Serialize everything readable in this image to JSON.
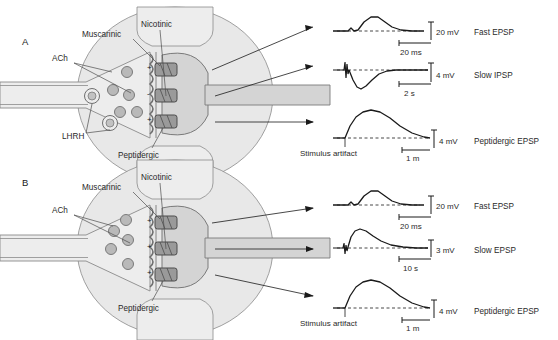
{
  "figure": {
    "width": 558,
    "height": 340,
    "background": "#ffffff"
  },
  "colors": {
    "cell_body_fill": "#e3e3e3",
    "axon_fill": "#ededed",
    "postsynaptic_fill": "#d2d2d2",
    "membrane_line": "#7a7a7a",
    "receptor_fill": "#9a9a9a",
    "vesicle_fill": "#b8b8b8",
    "trace_line": "#1a1a1a",
    "baseline_dash": "#1a1a1a",
    "text": "#2a2a2a"
  },
  "panels": [
    {
      "letter": "A",
      "diagram": {
        "presynaptic_labels": [
          {
            "name": "ACh",
            "text": "ACh"
          },
          {
            "name": "LHRH",
            "text": "LHRH"
          }
        ],
        "receptor_labels": [
          {
            "name": "Nicotinic",
            "text": "Nicotinic"
          },
          {
            "name": "Muscarinic",
            "text": "Muscarinic"
          },
          {
            "name": "Peptidergic",
            "text": "Peptidergic"
          }
        ],
        "receptor_signs": [
          "+",
          "-",
          "+"
        ]
      },
      "traces": [
        {
          "name": "Fast EPSP",
          "label": "Fast EPSP",
          "amplitude_scale": "20 mV",
          "time_scale": "20 ms",
          "polarity": "depolarizing",
          "shape": "fast-epsp"
        },
        {
          "name": "Slow IPSP",
          "label": "Slow IPSP",
          "amplitude_scale": "4 mV",
          "time_scale": "2 s",
          "polarity": "hyperpolarizing",
          "shape": "slow-ipsp"
        },
        {
          "name": "Peptidergic EPSP",
          "label": "Peptidergic EPSP",
          "amplitude_scale": "4 mV",
          "time_scale": "1 m",
          "polarity": "depolarizing",
          "shape": "peptidergic-epsp"
        }
      ],
      "annotation": "Stimulus artifact"
    },
    {
      "letter": "B",
      "diagram": {
        "presynaptic_labels": [
          {
            "name": "ACh",
            "text": "ACh"
          }
        ],
        "receptor_labels": [
          {
            "name": "Nicotinic",
            "text": "Nicotinic"
          },
          {
            "name": "Muscarinic",
            "text": "Muscarinic"
          },
          {
            "name": "Peptidergic",
            "text": "Peptidergic"
          }
        ],
        "receptor_signs": [
          "+",
          "+",
          "+"
        ]
      },
      "traces": [
        {
          "name": "Fast EPSP",
          "label": "Fast EPSP",
          "amplitude_scale": "20 mV",
          "time_scale": "20 ms",
          "polarity": "depolarizing",
          "shape": "fast-epsp"
        },
        {
          "name": "Slow EPSP",
          "label": "Slow EPSP",
          "amplitude_scale": "3 mV",
          "time_scale": "10 s",
          "polarity": "depolarizing",
          "shape": "slow-epsp"
        },
        {
          "name": "Peptidergic EPSP",
          "label": "Peptidergic EPSP",
          "amplitude_scale": "4 mV",
          "time_scale": "1 m",
          "polarity": "depolarizing",
          "shape": "peptidergic-epsp"
        }
      ],
      "annotation": "Stimulus artifact"
    }
  ]
}
